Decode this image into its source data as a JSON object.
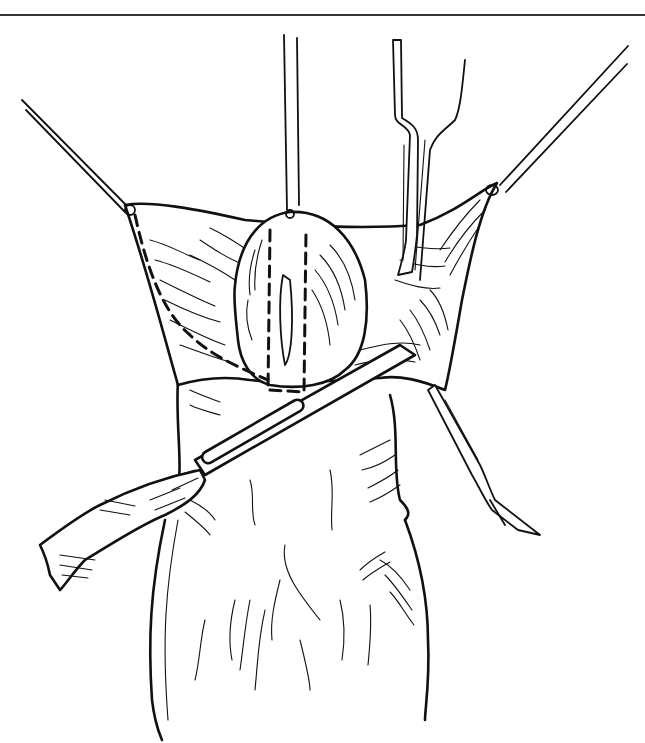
{
  "figure": {
    "type": "surgical line illustration",
    "background": "#ffffff",
    "ink_color": "#111111",
    "top_rule": {
      "y": 15
    },
    "elements": [
      "top-rule",
      "left-traction-suture",
      "center-traction-suture",
      "right-traction-suture",
      "forceps-upper",
      "retractor-lower-right",
      "scalpel",
      "tissue-flap",
      "glans-dome",
      "dashed-incision-line-left",
      "dashed-incision-rectangle",
      "shaft-body"
    ]
  }
}
